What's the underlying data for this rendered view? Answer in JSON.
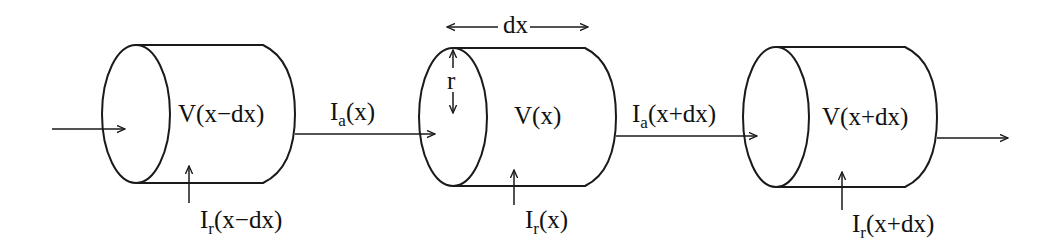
{
  "diagram": {
    "colors": {
      "stroke": "#1a1a1a",
      "text": "#111111",
      "background": "#ffffff"
    },
    "dimension_labels": {
      "length": "dx",
      "radius": "r"
    },
    "compartments": [
      {
        "id": "prev",
        "voltage_label": "V(x−dx)",
        "radial_current": {
          "main": "I",
          "sub": "r",
          "arg": "(x−dx)"
        }
      },
      {
        "id": "curr",
        "voltage_label": "V(x)",
        "radial_current": {
          "main": "I",
          "sub": "r",
          "arg": "(x)"
        }
      },
      {
        "id": "next",
        "voltage_label": "V(x+dx)",
        "radial_current": {
          "main": "I",
          "sub": "r",
          "arg": "(x+dx)"
        }
      }
    ],
    "axial_currents": [
      {
        "main": "I",
        "sub": "a",
        "arg": "(x)"
      },
      {
        "main": "I",
        "sub": "a",
        "arg": "(x+dx)"
      }
    ]
  }
}
